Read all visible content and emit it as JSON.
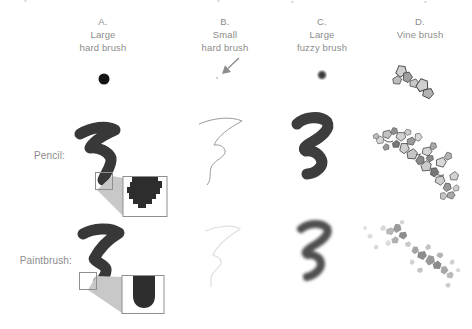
{
  "figure": {
    "columns": [
      {
        "letter": "A.",
        "line1": "Large",
        "line2": "hard brush"
      },
      {
        "letter": "B.",
        "line1": "Small",
        "line2": "hard brush"
      },
      {
        "letter": "C.",
        "line1": "Large",
        "line2": "fuzzy brush"
      },
      {
        "letter": "D.",
        "line1": "Vine brush",
        "line2": ""
      }
    ],
    "rows": [
      {
        "label": "Pencil:"
      },
      {
        "label": "Paintbrush:"
      }
    ],
    "icons": [
      "large-hard-brush-tip-dot",
      "small-brush-pointer-arrow",
      "large-fuzzy-brush-tip-dot",
      "vine-brush-tip-cluster",
      "zoom-inset-hard-edge",
      "zoom-inset-soft-edge"
    ],
    "colors": {
      "label_text": "#8c8c8c",
      "ink_dark": "#383838",
      "thin_line": "#9a9a9a",
      "faint_line": "#dedede",
      "callout_wedge": "#c8c8c8",
      "inset_border": "#8f8f8f",
      "inset_blob": "#2d2d2d",
      "background": "#ffffff"
    }
  }
}
